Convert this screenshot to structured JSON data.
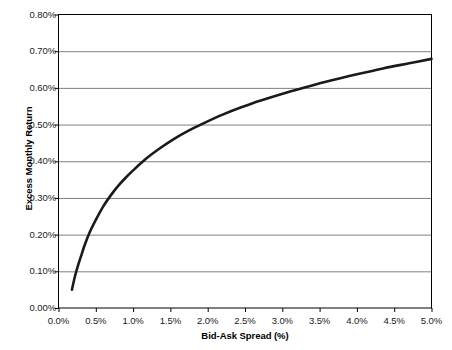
{
  "chart_data": {
    "type": "line",
    "title": "",
    "subtitle": "",
    "xlabel": "Bid-Ask Spread (%)",
    "ylabel": "Excess Monthly Return",
    "xlim": [
      0.0,
      5.0
    ],
    "ylim": [
      0.0,
      0.8
    ],
    "grid": "horizontal",
    "legend": "none",
    "x_tick_labels": [
      "0.0%",
      "0.5%",
      "1.0%",
      "1.5%",
      "2.0%",
      "2.5%",
      "3.0%",
      "3.5%",
      "4.0%",
      "4.5%",
      "5.0%"
    ],
    "x_tick_values": [
      0.0,
      0.5,
      1.0,
      1.5,
      2.0,
      2.5,
      3.0,
      3.5,
      4.0,
      4.5,
      5.0
    ],
    "y_tick_labels": [
      "0.00%",
      "0.10%",
      "0.20%",
      "0.30%",
      "0.40%",
      "0.50%",
      "0.60%",
      "0.70%",
      "0.80%"
    ],
    "y_tick_values": [
      0.0,
      0.1,
      0.2,
      0.3,
      0.4,
      0.5,
      0.6,
      0.7,
      0.8
    ],
    "series": [
      {
        "name": "Excess Monthly Return",
        "color": "#1a1a1a",
        "line_width": 2.6,
        "x": [
          0.18,
          0.22,
          0.26,
          0.3,
          0.35,
          0.42,
          0.5,
          0.6,
          0.7,
          0.8,
          0.9,
          1.0,
          1.18,
          1.35,
          1.55,
          1.75,
          1.95,
          2.2,
          2.45,
          2.7,
          3.05,
          3.35,
          3.65,
          4.0,
          4.35,
          4.7,
          5.0
        ],
        "y": [
          0.05,
          0.086,
          0.115,
          0.14,
          0.171,
          0.207,
          0.24,
          0.277,
          0.307,
          0.333,
          0.355,
          0.375,
          0.408,
          0.434,
          0.461,
          0.484,
          0.504,
          0.527,
          0.547,
          0.565,
          0.587,
          0.604,
          0.62,
          0.637,
          0.653,
          0.667,
          0.679
        ]
      }
    ],
    "annotations": []
  },
  "axes": {
    "x_title": "Bid-Ask Spread (%)",
    "y_title": "Excess Monthly Return",
    "x_ticks": [
      {
        "label": "0.0%",
        "value": 0.0
      },
      {
        "label": "0.5%",
        "value": 0.5
      },
      {
        "label": "1.0%",
        "value": 1.0
      },
      {
        "label": "1.5%",
        "value": 1.5
      },
      {
        "label": "2.0%",
        "value": 2.0
      },
      {
        "label": "2.5%",
        "value": 2.5
      },
      {
        "label": "3.0%",
        "value": 3.0
      },
      {
        "label": "3.5%",
        "value": 3.5
      },
      {
        "label": "4.0%",
        "value": 4.0
      },
      {
        "label": "4.5%",
        "value": 4.5
      },
      {
        "label": "5.0%",
        "value": 5.0
      }
    ],
    "y_ticks": [
      {
        "label": "0.00%",
        "value": 0.0
      },
      {
        "label": "0.10%",
        "value": 0.1
      },
      {
        "label": "0.20%",
        "value": 0.2
      },
      {
        "label": "0.30%",
        "value": 0.3
      },
      {
        "label": "0.40%",
        "value": 0.4
      },
      {
        "label": "0.50%",
        "value": 0.5
      },
      {
        "label": "0.60%",
        "value": 0.6
      },
      {
        "label": "0.70%",
        "value": 0.7
      },
      {
        "label": "0.80%",
        "value": 0.8
      }
    ]
  },
  "style": {
    "plot_background": "#ffffff",
    "grid_color": "#808080",
    "axis_color": "#000000",
    "curve_color": "#1a1a1a",
    "tick_text_color": "#1a1a1a"
  }
}
